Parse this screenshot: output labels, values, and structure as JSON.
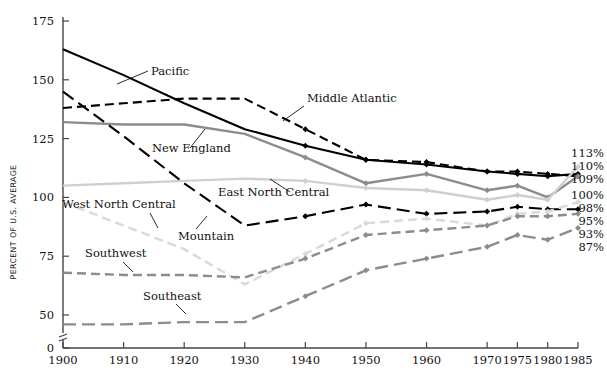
{
  "chart_data": {
    "type": "line",
    "title": "",
    "xlabel": "",
    "ylabel": "PERCENT OF U.S. AVERAGE",
    "ylim": [
      0,
      175
    ],
    "yticks": [
      0,
      50,
      75,
      100,
      125,
      150,
      175
    ],
    "y_axis_break": true,
    "grid": false,
    "legend": "inline-labels",
    "x": [
      "1900",
      "1910",
      "1920",
      "1930",
      "1940",
      "1950",
      "1960",
      "1970",
      "1975",
      "1980",
      "1985"
    ],
    "x_positions": [
      0,
      10,
      20,
      30,
      40,
      50,
      60,
      70,
      75,
      80,
      85
    ],
    "series": [
      {
        "name": "Pacific",
        "color": "#000000",
        "style": "solid",
        "end_label": "110%",
        "values": [
          163,
          152,
          140,
          129,
          122,
          116,
          114,
          111,
          110,
          109,
          110
        ]
      },
      {
        "name": "Middle Atlantic",
        "color": "#000000",
        "style": "dashed",
        "end_label": "109%",
        "values": [
          138,
          140,
          142,
          142,
          129,
          116,
          115,
          111,
          111,
          110,
          109
        ]
      },
      {
        "name": "New England",
        "color": "#8c8c8c",
        "style": "solid",
        "end_label": "109%",
        "values": [
          132,
          131,
          131,
          127,
          117,
          106,
          110,
          103,
          105,
          100,
          109
        ]
      },
      {
        "name": "East North Central",
        "color": "#cfcfcf",
        "style": "solid",
        "end_label": "113%",
        "values": [
          105,
          106,
          107,
          108,
          107,
          104,
          103,
          99,
          101,
          99,
          113
        ]
      },
      {
        "name": "Mountain",
        "color": "#000000",
        "style": "long-dash",
        "end_label": "95%",
        "values": [
          145,
          126,
          106,
          88,
          92,
          97,
          93,
          94,
          96,
          95,
          95
        ]
      },
      {
        "name": "West North Central",
        "color": "#d9d9d9",
        "style": "dashed",
        "end_label": "98%",
        "values": [
          98,
          88,
          78,
          63,
          76,
          89,
          91,
          88,
          93,
          94,
          98
        ]
      },
      {
        "name": "Southwest",
        "color": "#8c8c8c",
        "style": "dashed",
        "end_label": "93%",
        "values": [
          68,
          67,
          67,
          66,
          74,
          84,
          86,
          88,
          92,
          92,
          93
        ]
      },
      {
        "name": "Southeast",
        "color": "#8c8c8c",
        "style": "long-dash",
        "end_label": "87%",
        "values": [
          46,
          46,
          47,
          47,
          58,
          69,
          74,
          79,
          84,
          82,
          87
        ]
      }
    ],
    "end_labels_ordered": [
      "113%",
      "110%",
      "109%",
      "100%",
      "98%",
      "95%",
      "93%",
      "87%"
    ]
  },
  "axis": {
    "y_title": "PERCENT OF U.S. AVERAGE",
    "y_ticks": [
      "0",
      "50",
      "75",
      "100",
      "125",
      "150",
      "175"
    ],
    "x_ticks": [
      "1900",
      "1910",
      "1920",
      "1930",
      "1940",
      "1950",
      "1960",
      "1970",
      "1975",
      "1980",
      "1985"
    ]
  },
  "annotations": {
    "pacific": "Pacific",
    "middle_atlantic": "Middle Atlantic",
    "new_england": "New England",
    "east_north_central": "East North Central",
    "mountain": "Mountain",
    "west_north_central": "West North Central",
    "southwest": "Southwest",
    "southeast": "Southeast"
  },
  "end_labels": {
    "l113": "113%",
    "l110": "110%",
    "l109": "109%",
    "l100": "100%",
    "l98": "98%",
    "l95": "95%",
    "l93": "93%",
    "l87": "87%"
  }
}
